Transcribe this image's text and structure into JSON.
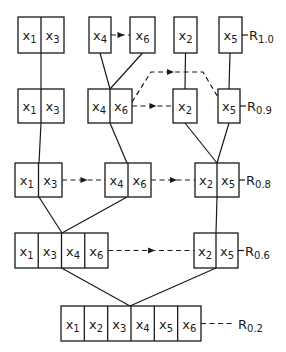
{
  "diagram": {
    "levels": [
      {
        "id": "R1.0",
        "label_main": "R",
        "label_sub": "1.0",
        "label_style": "solid",
        "groups": [
          {
            "id": "g1a",
            "vars": [
              "1",
              "3"
            ]
          },
          {
            "id": "g1b",
            "vars": [
              "4"
            ]
          },
          {
            "id": "g1c",
            "vars": [
              "6"
            ]
          },
          {
            "id": "g1d",
            "vars": [
              "2"
            ]
          },
          {
            "id": "g1e",
            "vars": [
              "5"
            ]
          }
        ]
      },
      {
        "id": "R0.9",
        "label_main": "R",
        "label_sub": "0.9",
        "label_style": "solid",
        "groups": [
          {
            "id": "g2a",
            "vars": [
              "1",
              "3"
            ]
          },
          {
            "id": "g2b",
            "vars": [
              "4",
              "6"
            ]
          },
          {
            "id": "g2c",
            "vars": [
              "2"
            ]
          },
          {
            "id": "g2d",
            "vars": [
              "5"
            ]
          }
        ]
      },
      {
        "id": "R0.8",
        "label_main": "R",
        "label_sub": "0.8",
        "label_style": "solid",
        "groups": [
          {
            "id": "g3a",
            "vars": [
              "1",
              "3"
            ]
          },
          {
            "id": "g3b",
            "vars": [
              "4",
              "6"
            ]
          },
          {
            "id": "g3c",
            "vars": [
              "2",
              "5"
            ]
          }
        ]
      },
      {
        "id": "R0.6",
        "label_main": "R",
        "label_sub": "0.6",
        "label_style": "solid",
        "groups": [
          {
            "id": "g4a",
            "vars": [
              "1",
              "3",
              "4",
              "6"
            ]
          },
          {
            "id": "g4b",
            "vars": [
              "2",
              "5"
            ]
          }
        ]
      },
      {
        "id": "R0.2",
        "label_main": "R",
        "label_sub": "0.2",
        "label_style": "dashed",
        "groups": [
          {
            "id": "g5a",
            "vars": [
              "1",
              "2",
              "3",
              "4",
              "5",
              "6"
            ]
          }
        ]
      }
    ],
    "variable_prefix": "x",
    "merge_edges": [
      {
        "from": "g1a",
        "to": "g2a"
      },
      {
        "from": "g1b",
        "to": "g2b"
      },
      {
        "from": "g1c",
        "to": "g2b"
      },
      {
        "from": "g1d",
        "to": "g2c"
      },
      {
        "from": "g1e",
        "to": "g2d"
      },
      {
        "from": "g2a",
        "to": "g3a"
      },
      {
        "from": "g2b",
        "to": "g3b"
      },
      {
        "from": "g2c",
        "to": "g3c"
      },
      {
        "from": "g2d",
        "to": "g3c"
      },
      {
        "from": "g3a",
        "to": "g4a"
      },
      {
        "from": "g3b",
        "to": "g4a"
      },
      {
        "from": "g3c",
        "to": "g4b"
      },
      {
        "from": "g4a",
        "to": "g5a"
      },
      {
        "from": "g4b",
        "to": "g5a"
      }
    ],
    "dashed_arrows": [
      {
        "from": "g1b",
        "to": "g1c"
      },
      {
        "from": "g2b",
        "to": "g2c"
      },
      {
        "from": "g2b",
        "to": "g2d",
        "routed_above": true
      },
      {
        "from": "g3a",
        "to": "g3b"
      },
      {
        "from": "g3b",
        "to": "g3c"
      },
      {
        "from": "g4a",
        "to": "g4b"
      }
    ]
  }
}
